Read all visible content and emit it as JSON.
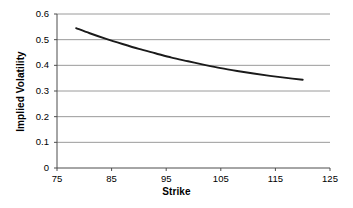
{
  "chart_data": {
    "type": "line",
    "title": "",
    "xlabel": "Strike",
    "ylabel": "Implied Volatility",
    "xlim": [
      75,
      125
    ],
    "ylim": [
      0,
      0.6
    ],
    "xticks": [
      "75",
      "85",
      "95",
      "105",
      "115",
      "125"
    ],
    "xtick_values": [
      75,
      85,
      95,
      105,
      115,
      125
    ],
    "yticks": [
      "0",
      "0.1",
      "0.2",
      "0.3",
      "0.4",
      "0.5",
      "0.6"
    ],
    "ytick_values": [
      0,
      0.1,
      0.2,
      0.3,
      0.4,
      0.5,
      0.6
    ],
    "grid": "horizontal",
    "legend": "none",
    "series": [
      {
        "name": "Implied Volatility Skew",
        "color": "#1a1a1a",
        "x": [
          78.5,
          81,
          84,
          87,
          90,
          93,
          96,
          99,
          102,
          105,
          108,
          111,
          114,
          117,
          120
        ],
        "values": [
          0.545,
          0.525,
          0.503,
          0.483,
          0.464,
          0.447,
          0.43,
          0.416,
          0.402,
          0.389,
          0.378,
          0.368,
          0.359,
          0.351,
          0.344
        ]
      }
    ]
  },
  "axes": {
    "y_label_text": "Implied Volatility",
    "x_label_text": "Strike"
  },
  "style": {
    "grid_color": "#9a9a9a",
    "axis_color": "#4d4d4d",
    "curve_color": "#1a1a1a",
    "background": "#ffffff",
    "text_color": "#000000"
  }
}
